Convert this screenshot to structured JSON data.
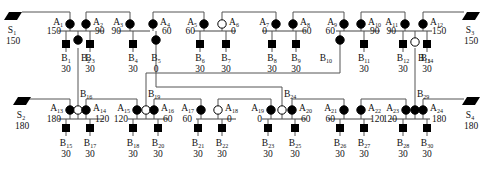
{
  "diagram": {
    "colors": {
      "line": "#555555",
      "fill": "#000000",
      "open": "#ffffff",
      "text": "#111111"
    },
    "sources": [
      {
        "id": "S1",
        "name": "S",
        "sub": "1",
        "value": "150",
        "x": 13,
        "y": 16,
        "side": "left",
        "row": "top",
        "connect_to_x": 70
      },
      {
        "id": "S3",
        "name": "S",
        "sub": "3",
        "value": "150",
        "x": 471,
        "y": 16,
        "side": "right",
        "row": "top",
        "connect_to_x": 418
      },
      {
        "id": "S2",
        "name": "S",
        "sub": "2",
        "value": "180",
        "x": 22,
        "y": 101,
        "side": "left",
        "row": "bottom",
        "connect_to_x": 70
      },
      {
        "id": "S4",
        "name": "S",
        "sub": "4",
        "value": "180",
        "x": 471,
        "y": 101,
        "side": "right",
        "row": "bottom",
        "connect_to_x": 406
      }
    ],
    "top_groups": [
      {
        "bus": [
          58,
          104
        ],
        "nodes": [
          {
            "id": "A1",
            "name": "A",
            "sub": "1",
            "value": "150",
            "x": 70,
            "open": false,
            "label_side": "left"
          },
          {
            "id": "A2",
            "name": "A",
            "sub": "2",
            "value": "90",
            "x": 86,
            "open": false,
            "label_side": "right"
          }
        ],
        "loads": [
          {
            "id": "B1",
            "name": "B",
            "sub": "1",
            "value": "30",
            "x": 66,
            "kind": "square"
          },
          {
            "id": "B2",
            "name": "B",
            "sub": "2",
            "value": "",
            "x": 78,
            "kind": "dot"
          },
          {
            "id": "B3",
            "name": "B",
            "sub": "3",
            "value": "30",
            "x": 90,
            "kind": "square"
          }
        ]
      },
      {
        "bus": [
          118,
          150
        ],
        "nodes": [
          {
            "id": "A3",
            "name": "A",
            "sub": "3",
            "value": "90",
            "x": 130,
            "open": false,
            "label_side": "left"
          },
          {
            "id": "A4",
            "name": "A",
            "sub": "4",
            "value": "60",
            "x": 153,
            "open": false,
            "label_side": "right"
          }
        ],
        "loads": [
          {
            "id": "B4",
            "name": "B",
            "sub": "4",
            "value": "30",
            "x": 133,
            "kind": "square"
          },
          {
            "id": "B5",
            "name": "B",
            "sub": "5",
            "value": "0",
            "x": 156,
            "kind": "dot"
          }
        ]
      },
      {
        "bus": [
          194,
          236
        ],
        "nodes": [
          {
            "id": "A5",
            "name": "A",
            "sub": "5",
            "value": "60",
            "x": 204,
            "open": false,
            "label_side": "left"
          },
          {
            "id": "A6",
            "name": "A",
            "sub": "6",
            "value": "0",
            "x": 222,
            "open": true,
            "label_side": "right"
          }
        ],
        "loads": [
          {
            "id": "B6",
            "name": "B",
            "sub": "6",
            "value": "30",
            "x": 200,
            "kind": "square"
          },
          {
            "id": "B7",
            "name": "B",
            "sub": "7",
            "value": "30",
            "x": 226,
            "kind": "square"
          }
        ]
      },
      {
        "bus": [
          262,
          306
        ],
        "nodes": [
          {
            "id": "A7",
            "name": "A",
            "sub": "7",
            "value": "0",
            "x": 276,
            "open": false,
            "label_side": "left"
          },
          {
            "id": "A8",
            "name": "A",
            "sub": "8",
            "value": "60",
            "x": 293,
            "open": false,
            "label_side": "right"
          }
        ],
        "loads": [
          {
            "id": "B8",
            "name": "B",
            "sub": "8",
            "value": "30",
            "x": 272,
            "kind": "square"
          },
          {
            "id": "B9",
            "name": "B",
            "sub": "9",
            "value": "30",
            "x": 296,
            "kind": "square"
          }
        ]
      },
      {
        "bus": [
          336,
          380
        ],
        "nodes": [
          {
            "id": "A9",
            "name": "A",
            "sub": "9",
            "value": "60",
            "x": 344,
            "open": false,
            "label_side": "left"
          },
          {
            "id": "A10",
            "name": "A",
            "sub": "10",
            "value": "90",
            "x": 361,
            "open": false,
            "label_side": "right"
          }
        ],
        "loads": [
          {
            "id": "B10",
            "name": "B",
            "sub": "10",
            "value": "",
            "x": 340,
            "kind": "dot"
          },
          {
            "id": "B11",
            "name": "B",
            "sub": "11",
            "value": "30",
            "x": 364,
            "kind": "square"
          }
        ]
      },
      {
        "bus": [
          388,
          432
        ],
        "nodes": [
          {
            "id": "A11",
            "name": "A",
            "sub": "11",
            "value": "90",
            "x": 405,
            "open": false,
            "label_side": "left"
          },
          {
            "id": "A12",
            "name": "A",
            "sub": "12",
            "value": "150",
            "x": 423,
            "open": false,
            "label_side": "right"
          }
        ],
        "loads": [
          {
            "id": "B12",
            "name": "B",
            "sub": "12",
            "value": "30",
            "x": 403,
            "kind": "square"
          },
          {
            "id": "B13",
            "name": "B",
            "sub": "13",
            "value": "",
            "x": 415,
            "kind": "open"
          },
          {
            "id": "B14",
            "name": "B",
            "sub": "14",
            "value": "30",
            "x": 427,
            "kind": "square"
          }
        ]
      }
    ],
    "bottom_groups": [
      {
        "bus": [
          58,
          104
        ],
        "nodes": [
          {
            "id": "A13",
            "name": "A",
            "sub": "13",
            "value": "180",
            "x": 70,
            "open": false,
            "label_side": "left"
          },
          {
            "id": "B16",
            "name": "B",
            "sub": "16",
            "value": "",
            "x": 78,
            "open": true,
            "label_side": "none"
          },
          {
            "id": "A14",
            "name": "A",
            "sub": "14",
            "value": "120",
            "x": 86,
            "open": false,
            "label_side": "right"
          }
        ],
        "loads": [
          {
            "id": "B15",
            "name": "B",
            "sub": "15",
            "value": "30",
            "x": 66,
            "kind": "square"
          },
          {
            "id": "B17",
            "name": "B",
            "sub": "17",
            "value": "30",
            "x": 90,
            "kind": "square"
          }
        ]
      },
      {
        "bus": [
          128,
          168
        ],
        "nodes": [
          {
            "id": "A15",
            "name": "A",
            "sub": "15",
            "value": "120",
            "x": 137,
            "open": false,
            "label_side": "left"
          },
          {
            "id": "B19",
            "name": "B",
            "sub": "19",
            "value": "",
            "x": 146,
            "open": true,
            "label_side": "none"
          },
          {
            "id": "A16",
            "name": "A",
            "sub": "16",
            "value": "60",
            "x": 154,
            "open": false,
            "label_side": "right"
          }
        ],
        "loads": [
          {
            "id": "B18",
            "name": "B",
            "sub": "18",
            "value": "30",
            "x": 133,
            "kind": "square"
          },
          {
            "id": "B20",
            "name": "B",
            "sub": "20",
            "value": "30",
            "x": 158,
            "kind": "square"
          }
        ]
      },
      {
        "bus": [
          196,
          236
        ],
        "nodes": [
          {
            "id": "A17",
            "name": "A",
            "sub": "17",
            "value": "60",
            "x": 201,
            "open": false,
            "label_side": "left"
          },
          {
            "id": "A18",
            "name": "A",
            "sub": "18",
            "value": "0",
            "x": 218,
            "open": true,
            "label_side": "right"
          }
        ],
        "loads": [
          {
            "id": "B21",
            "name": "B",
            "sub": "21",
            "value": "30",
            "x": 198,
            "kind": "square"
          },
          {
            "id": "B22",
            "name": "B",
            "sub": "22",
            "value": "30",
            "x": 222,
            "kind": "square"
          }
        ]
      },
      {
        "bus": [
          262,
          306
        ],
        "nodes": [
          {
            "id": "A19",
            "name": "A",
            "sub": "19",
            "value": "0",
            "x": 271,
            "open": false,
            "label_side": "left"
          },
          {
            "id": "B24",
            "name": "B",
            "sub": "24",
            "value": "",
            "x": 282,
            "open": true,
            "label_side": "none"
          },
          {
            "id": "A20",
            "name": "A",
            "sub": "20",
            "value": "60",
            "x": 292,
            "open": false,
            "label_side": "right"
          }
        ],
        "loads": [
          {
            "id": "B23",
            "name": "B",
            "sub": "23",
            "value": "30",
            "x": 268,
            "kind": "square"
          },
          {
            "id": "B25",
            "name": "B",
            "sub": "25",
            "value": "30",
            "x": 295,
            "kind": "square"
          }
        ]
      },
      {
        "bus": [
          328,
          372
        ],
        "nodes": [
          {
            "id": "A21",
            "name": "A",
            "sub": "21",
            "value": "60",
            "x": 344,
            "open": false,
            "label_side": "left"
          },
          {
            "id": "A22",
            "name": "A",
            "sub": "22",
            "value": "120",
            "x": 361,
            "open": false,
            "label_side": "right"
          }
        ],
        "loads": [
          {
            "id": "B26",
            "name": "B",
            "sub": "26",
            "value": "30",
            "x": 340,
            "kind": "square"
          },
          {
            "id": "B27",
            "name": "B",
            "sub": "27",
            "value": "30",
            "x": 364,
            "kind": "square"
          }
        ]
      },
      {
        "bus": [
          390,
          430
        ],
        "nodes": [
          {
            "id": "A23",
            "name": "A",
            "sub": "23",
            "value": "120",
            "x": 406,
            "open": false,
            "label_side": "left"
          },
          {
            "id": "B29",
            "name": "B",
            "sub": "29",
            "value": "",
            "x": 415,
            "open": false,
            "label_side": "none"
          },
          {
            "id": "A24",
            "name": "A",
            "sub": "24",
            "value": "180",
            "x": 423,
            "open": false,
            "label_side": "right"
          }
        ],
        "loads": [
          {
            "id": "B28",
            "name": "B",
            "sub": "28",
            "value": "30",
            "x": 403,
            "kind": "square"
          },
          {
            "id": "B30",
            "name": "B",
            "sub": "30",
            "value": "30",
            "x": 427,
            "kind": "square"
          }
        ]
      }
    ],
    "tie_labels": [
      {
        "id": "B16",
        "name": "B",
        "sub": "16",
        "x": 80,
        "y": 97
      },
      {
        "id": "B19",
        "name": "B",
        "sub": "19",
        "x": 148,
        "y": 97
      },
      {
        "id": "B24",
        "name": "B",
        "sub": "24",
        "x": 284,
        "y": 97
      },
      {
        "id": "B29",
        "name": "B",
        "sub": "29",
        "x": 417,
        "y": 97
      }
    ],
    "tie_lines": [
      {
        "from": "B2",
        "to": "B16",
        "points": "78,48 78,106"
      },
      {
        "from": "B5",
        "to": "B24",
        "points": "156,40 156,87 282,87 282,106"
      },
      {
        "from": "B10",
        "to": "B19",
        "points": "340,43 340,73 146,73 146,106"
      },
      {
        "from": "B13",
        "to": "B29",
        "points": "415,48 415,106"
      }
    ],
    "top_feeds": [
      {
        "points": "70,20 70,12 22,12"
      },
      {
        "points": "86,20 86,12 130,12 130,20"
      },
      {
        "points": "153,20 153,12 204,12 204,20"
      },
      {
        "points": "222,20 222,12 276,12 276,20"
      },
      {
        "points": "293,20 293,12 344,12 344,20"
      },
      {
        "points": "361,20 361,12 405,12 405,20"
      },
      {
        "points": "423,20 423,12 464,12"
      }
    ],
    "bottom_feeds": [
      {
        "points": "70,106 70,99 28,99"
      },
      {
        "points": "86,106 86,99 137,99 137,106"
      },
      {
        "points": "154,106 154,99 201,99 201,106"
      },
      {
        "points": "218,106 218,99 271,99 271,106"
      },
      {
        "points": "292,106 292,99 344,99 344,106"
      },
      {
        "points": "361,106 361,99 406,99 406,106"
      },
      {
        "points": "423,106 423,99 464,99"
      }
    ]
  }
}
